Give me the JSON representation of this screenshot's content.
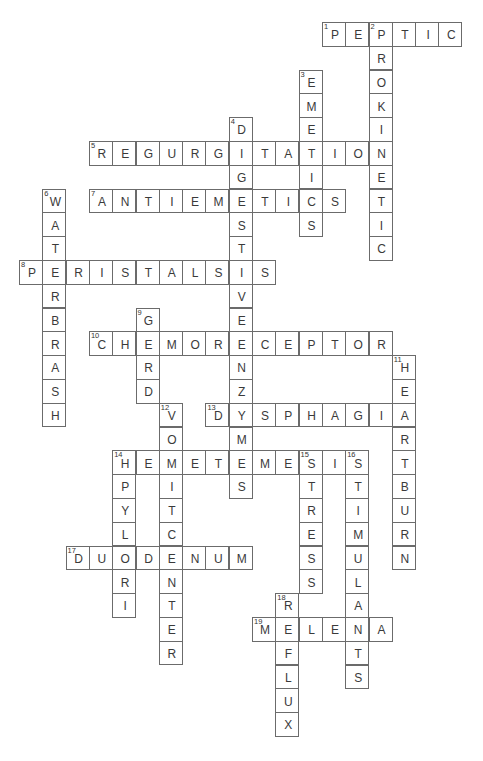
{
  "puzzle": {
    "grid": {
      "origin_x": 19,
      "origin_y": 22,
      "cell_w": 23.3,
      "cell_h": 23.8
    },
    "line_color": "#6b6b6b",
    "text_color": "#3a3a3a",
    "words": [
      {
        "number": 1,
        "direction": "across",
        "row": 0,
        "col": 13,
        "answer": "PEPTIC"
      },
      {
        "number": 2,
        "direction": "down",
        "row": 0,
        "col": 15,
        "answer": "PROKINETIC"
      },
      {
        "number": 3,
        "direction": "down",
        "row": 2,
        "col": 12,
        "answer": "EMETICS"
      },
      {
        "number": 4,
        "direction": "down",
        "row": 4,
        "col": 9,
        "answer": "DIGESTIVEENZYMES"
      },
      {
        "number": 5,
        "direction": "across",
        "row": 5,
        "col": 3,
        "answer": "REGURGITATION"
      },
      {
        "number": 6,
        "direction": "down",
        "row": 7,
        "col": 1,
        "answer": "WATERBRASH"
      },
      {
        "number": 7,
        "direction": "across",
        "row": 7,
        "col": 3,
        "answer": "ANTIEMETICS"
      },
      {
        "number": 8,
        "direction": "across",
        "row": 10,
        "col": 0,
        "answer": "PERISTALSIS"
      },
      {
        "number": 9,
        "direction": "down",
        "row": 12,
        "col": 5,
        "answer": "GERD"
      },
      {
        "number": 10,
        "direction": "across",
        "row": 13,
        "col": 3,
        "answer": "CHEMORECEPTOR"
      },
      {
        "number": 11,
        "direction": "down",
        "row": 14,
        "col": 16,
        "answer": "HEARTBURN"
      },
      {
        "number": 12,
        "direction": "down",
        "row": 16,
        "col": 6,
        "answer": "VOMITCENTER"
      },
      {
        "number": 13,
        "direction": "across",
        "row": 16,
        "col": 8,
        "answer": "DYSPHAGIA"
      },
      {
        "number": 14,
        "direction": "across",
        "row": 18,
        "col": 4,
        "answer": "HEMETEMESIS"
      },
      {
        "number": 14,
        "direction": "down",
        "row": 18,
        "col": 4,
        "answer": "HPYLORI"
      },
      {
        "number": 15,
        "direction": "down",
        "row": 18,
        "col": 12,
        "answer": "STRESS"
      },
      {
        "number": 16,
        "direction": "down",
        "row": 18,
        "col": 14,
        "answer": "STIMULANTS"
      },
      {
        "number": 17,
        "direction": "across",
        "row": 22,
        "col": 2,
        "answer": "DUODENUM"
      },
      {
        "number": 18,
        "direction": "down",
        "row": 24,
        "col": 11,
        "answer": "REFLUX"
      },
      {
        "number": 19,
        "direction": "across",
        "row": 25,
        "col": 10,
        "answer": "MELENA"
      }
    ]
  }
}
